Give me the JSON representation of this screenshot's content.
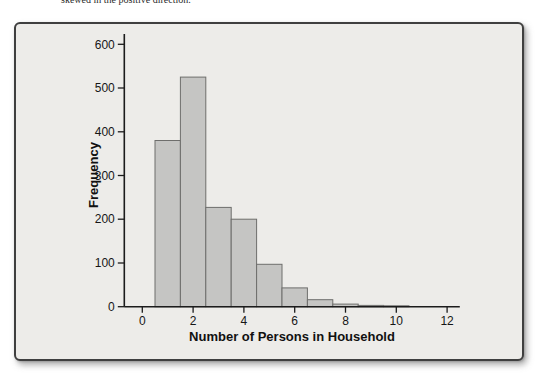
{
  "context_text": "skewed in the positive direction.",
  "figure": {
    "panel_bg": "#edece9",
    "panel_border": "#3f3f3f",
    "bar_fill": "#c5c5c3",
    "bar_stroke": "#6e6e6c",
    "axis_color": "#1c1c1c"
  },
  "chart_data": {
    "type": "bar",
    "subtype": "histogram",
    "title": "",
    "xlabel": "Number of Persons in Household",
    "ylabel": "Frequency",
    "bin_centers": [
      1,
      2,
      3,
      4,
      5,
      6,
      7,
      8,
      9,
      10
    ],
    "bin_width": 1,
    "values": [
      380,
      525,
      227,
      200,
      97,
      43,
      16,
      6,
      3,
      2
    ],
    "x_ticks": [
      0,
      2,
      4,
      6,
      8,
      10,
      12
    ],
    "y_ticks": [
      0,
      100,
      200,
      300,
      400,
      500,
      600
    ],
    "xlim": [
      -0.72,
      12.5
    ],
    "ylim": [
      0,
      600
    ],
    "grid": false,
    "legend": false
  }
}
